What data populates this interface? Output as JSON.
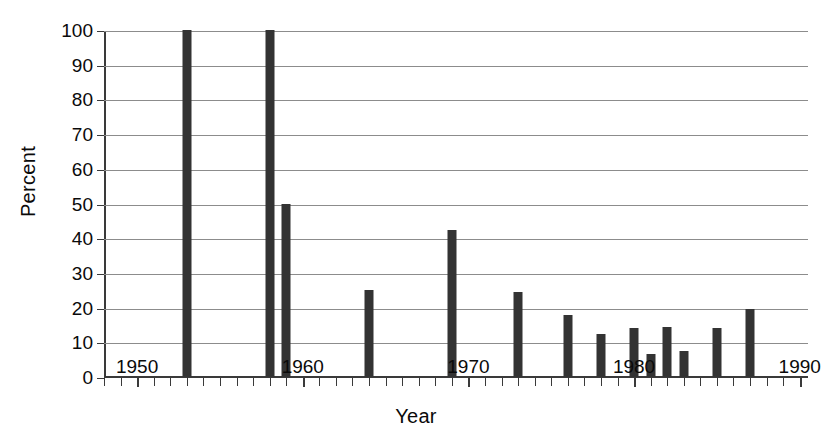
{
  "chart_data": {
    "type": "bar",
    "title": "",
    "xlabel": "Year",
    "ylabel": "Percent",
    "xlim": [
      1948,
      1990.5
    ],
    "ylim": [
      0,
      100
    ],
    "grid": true,
    "legend": null,
    "xticks_major": [
      1950,
      1960,
      1970,
      1980,
      1990
    ],
    "xtick_labels": [
      "1950",
      "1960",
      "1970",
      "1980",
      "1990"
    ],
    "xticks_minor_step": 1,
    "yticks": [
      0,
      10,
      20,
      30,
      40,
      50,
      60,
      70,
      80,
      90,
      100
    ],
    "ytick_labels": [
      "0",
      "10",
      "20",
      "30",
      "40",
      "50",
      "60",
      "70",
      "80",
      "90",
      "100"
    ],
    "x": [
      1953,
      1958,
      1959,
      1964,
      1969,
      1973,
      1976,
      1978,
      1980,
      1981,
      1982,
      1983,
      1985,
      1987
    ],
    "values": [
      100,
      100,
      50,
      25,
      42.5,
      24.5,
      18,
      12.5,
      14,
      6.5,
      14.5,
      7.5,
      14,
      19.5
    ],
    "bar_color": "#333333",
    "grid_color": "#8c8c8c",
    "axis_color": "#3a3a3a"
  }
}
